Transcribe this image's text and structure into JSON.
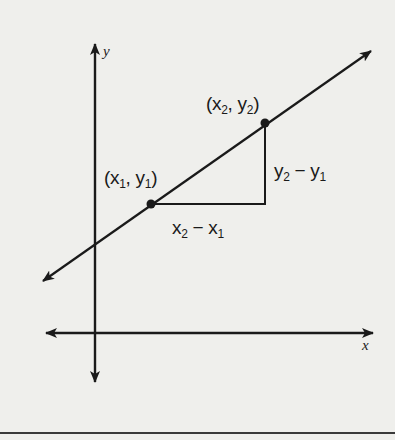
{
  "diagram": {
    "axes": {
      "x_label": "x",
      "y_label": "y"
    },
    "points": [
      {
        "id": "p1",
        "label_open": "(",
        "x_var": "x",
        "x_sub": "1",
        "sep": ", ",
        "y_var": "y",
        "y_sub": "1",
        "label_close": ")"
      },
      {
        "id": "p2",
        "label_open": "(",
        "x_var": "x",
        "x_sub": "2",
        "sep": ", ",
        "y_var": "y",
        "y_sub": "2",
        "label_close": ")"
      }
    ],
    "rise": {
      "a": "y",
      "a_sub": "2",
      "op": " − ",
      "b": "y",
      "b_sub": "1"
    },
    "run": {
      "a": "x",
      "a_sub": "2",
      "op": " − ",
      "b": "x",
      "b_sub": "1"
    },
    "colors": {
      "background": "#efefec",
      "ink": "#1a1a1a"
    }
  }
}
